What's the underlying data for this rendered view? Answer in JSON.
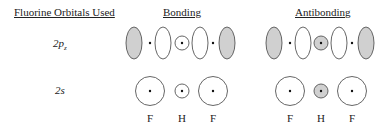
{
  "headers": {
    "orbitals_used": "Fluorine Orbitals Used",
    "bonding": "Bonding",
    "antibonding": "Antibonding"
  },
  "rows": [
    {
      "label_main": "2p",
      "label_sub": "z"
    },
    {
      "label_main": "2s",
      "label_sub": ""
    }
  ],
  "atom_labels": {
    "bonding": [
      "F",
      "H",
      "F"
    ],
    "antibonding": [
      "F",
      "H",
      "F"
    ]
  },
  "colors": {
    "shaded_lobe": "#d0d0d0",
    "outline": "#555555",
    "dot": "#111111",
    "background": "#ffffff"
  },
  "diagram": {
    "bonding_2pz": [
      "F 2pz lobes (shaded outer, white inner)",
      "H 1s unshaded",
      "F 2pz lobes (white inner, shaded outer)"
    ],
    "antibonding_2pz": [
      "F 2pz lobes (shaded outer, white inner)",
      "H 1s shaded",
      "F 2pz lobes (white inner, shaded outer)"
    ],
    "bonding_2s": [
      "F 2s unshaded",
      "H 1s unshaded",
      "F 2s unshaded"
    ],
    "antibonding_2s": [
      "F 2s unshaded",
      "H 1s shaded",
      "F 2s unshaded"
    ]
  }
}
